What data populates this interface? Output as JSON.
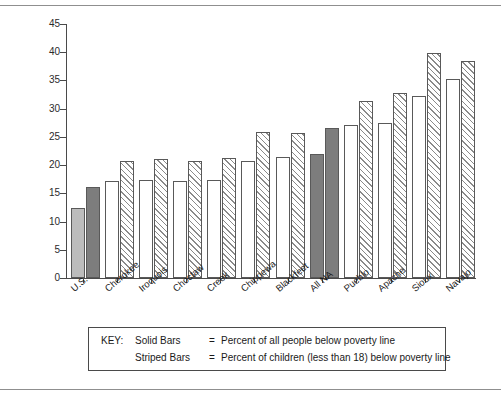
{
  "chart_data": {
    "type": "bar",
    "title": "",
    "xlabel": "",
    "ylabel": "Percent",
    "ylim": [
      0,
      45
    ],
    "yticks": [
      0,
      5,
      10,
      15,
      20,
      25,
      30,
      35,
      40,
      45
    ],
    "grid": false,
    "legend_position": "below-axes",
    "categories": [
      "U.S.",
      "Cherokee",
      "Iroquois",
      "Choctaw",
      "Creek",
      "Chippewa",
      "Blackfeet",
      "All NA",
      "Pueblo",
      "Apache",
      "Sioux",
      "Navajo"
    ],
    "series": [
      {
        "name": "Percent of all people below poverty line",
        "style": "Solid Bars",
        "values": [
          12.4,
          17.2,
          17.3,
          17.2,
          17.3,
          20.8,
          21.5,
          22.0,
          27.1,
          27.5,
          32.3,
          35.2
        ]
      },
      {
        "name": "Percent of children (less than 18) below poverty line",
        "style": "Striped Bars",
        "values": [
          16.1,
          20.8,
          21.1,
          20.7,
          21.2,
          25.8,
          25.7,
          26.5,
          31.3,
          32.7,
          39.8,
          38.5
        ]
      }
    ],
    "bar_fills": {
      "U.S.": {
        "left": "solid-light",
        "right": "solid-dark"
      },
      "All NA": {
        "left": "solid-dark",
        "right": "solid-dark"
      },
      "default": {
        "left": "open",
        "right": "striped"
      }
    },
    "colors": {
      "solid_light": "#bcbcbc",
      "solid_dark": "#7d7d7d",
      "open": "#ffffff",
      "stripe": "#8a8a8a",
      "axis": "#4a4a4a",
      "bar_outline": "#595959"
    }
  },
  "key": {
    "title": "KEY:",
    "rows": [
      {
        "kind": "Solid Bars",
        "eq": "=",
        "text": "Percent of all people below poverty line"
      },
      {
        "kind": "Striped Bars",
        "eq": "=",
        "text": "Percent of children (less than 18) below poverty line"
      }
    ]
  }
}
